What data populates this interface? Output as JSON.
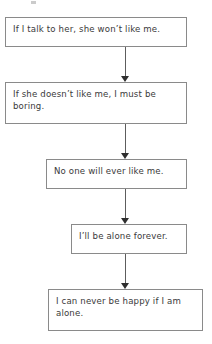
{
  "diagram": {
    "type": "downward-arrow-flowchart",
    "orientation": "vertical",
    "node_count": 5,
    "connector_count": 4,
    "colors": {
      "background": "#ffffff",
      "node_border": "#8a8a8a",
      "node_fill": "#ffffff",
      "text": "#3a3a3a",
      "connector_line": "#5d5d5d",
      "arrowhead": "#2f2f2f"
    },
    "nodes": [
      {
        "id": "node-0",
        "text": "If I talk to her, she won’t like me."
      },
      {
        "id": "node-1",
        "text": "If she doesn’t like me, I must be boring."
      },
      {
        "id": "node-2",
        "text": "No one will ever like me."
      },
      {
        "id": "node-3",
        "text": "I’ll be alone forever."
      },
      {
        "id": "node-4",
        "text": "I can never be happy if I am alone."
      }
    ],
    "connectors": [
      {
        "id": "conn-0",
        "from": "node-0",
        "to": "node-1",
        "arrow": "down"
      },
      {
        "id": "conn-1",
        "from": "node-1",
        "to": "node-2",
        "arrow": "down"
      },
      {
        "id": "conn-2",
        "from": "node-2",
        "to": "node-3",
        "arrow": "down"
      },
      {
        "id": "conn-3",
        "from": "node-3",
        "to": "node-4",
        "arrow": "down"
      }
    ]
  }
}
